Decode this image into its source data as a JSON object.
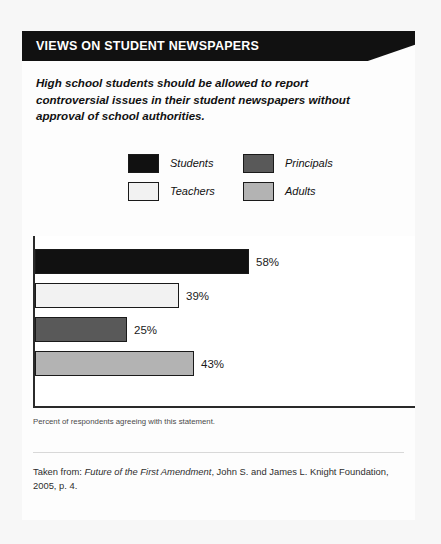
{
  "header": {
    "title": "VIEWS ON STUDENT NEWSPAPERS"
  },
  "statement": {
    "text": "High school students should be allowed to report controversial issues in their student newspapers without approval of school authorities."
  },
  "legend": {
    "items": [
      {
        "label": "Students",
        "color": "#111111",
        "position": "top-left"
      },
      {
        "label": "Principals",
        "color": "#595959",
        "position": "top-right"
      },
      {
        "label": "Teachers",
        "color": "#f2f2f2",
        "position": "bottom-left"
      },
      {
        "label": "Adults",
        "color": "#b3b3b3",
        "position": "bottom-right"
      }
    ]
  },
  "chart_caption": "Percent of respondents agreeing with this statement.",
  "source": {
    "prefix": "Taken from: ",
    "title": "Future of the First Amendment",
    "suffix": ", John S. and James L. Knight Foundation, 2005, p. 4."
  },
  "chart_data": {
    "type": "bar",
    "orientation": "horizontal",
    "title": "VIEWS ON STUDENT NEWSPAPERS",
    "subtitle": "High school students should be allowed to report controversial issues in their student newspapers without approval of school authorities.",
    "xlabel": "",
    "ylabel": "",
    "xlim": [
      0,
      100
    ],
    "grid": false,
    "legend_position": "above-plot",
    "categories": [
      "Students",
      "Teachers",
      "Principals",
      "Adults"
    ],
    "values": [
      58,
      39,
      25,
      43
    ],
    "value_labels": [
      "58%",
      "39%",
      "25%",
      "43%"
    ],
    "colors": [
      "#111111",
      "#f2f2f2",
      "#595959",
      "#b3b3b3"
    ],
    "note": "Percent of respondents agreeing with this statement.",
    "bars": [
      {
        "category": "Students",
        "value": 58,
        "label": "58%",
        "color": "#111111"
      },
      {
        "category": "Teachers",
        "value": 39,
        "label": "39%",
        "color": "#f2f2f2"
      },
      {
        "category": "Principals",
        "value": 25,
        "label": "25%",
        "color": "#595959"
      },
      {
        "category": "Adults",
        "value": 43,
        "label": "43%",
        "color": "#b3b3b3"
      }
    ]
  }
}
